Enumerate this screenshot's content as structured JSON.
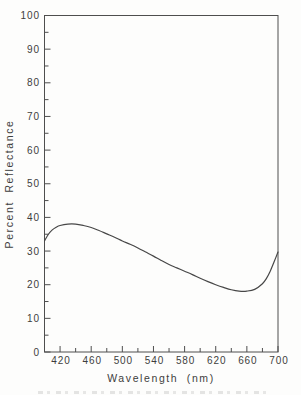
{
  "chart_data": {
    "type": "line",
    "title": "",
    "xlabel": "Wavelength  (nm)",
    "ylabel": "Percent  Reflectance",
    "xlim": [
      400,
      700
    ],
    "ylim": [
      0,
      100
    ],
    "grid": false,
    "legend": false,
    "frame": "full-box",
    "x_major_ticks": [
      420,
      460,
      500,
      540,
      580,
      620,
      660,
      700
    ],
    "x_minor_ticks": [
      440,
      480,
      520,
      560,
      600,
      640,
      680
    ],
    "x_tick_labels": [
      "420",
      "460",
      "500",
      "540",
      "580",
      "620",
      "660",
      "700"
    ],
    "y_major_ticks": [
      0,
      10,
      20,
      30,
      40,
      50,
      60,
      70,
      80,
      90,
      100
    ],
    "y_minor_ticks": [
      5,
      15,
      25,
      35,
      45,
      55,
      65,
      75,
      85,
      95
    ],
    "y_tick_labels": [
      "0",
      "10",
      "20",
      "30",
      "40",
      "50",
      "60",
      "70",
      "80",
      "90",
      "100"
    ],
    "series": [
      {
        "name": "reflectance-curve",
        "x": [
          400,
          405,
          410,
          415,
          420,
          430,
          440,
          450,
          460,
          470,
          480,
          490,
          500,
          510,
          520,
          530,
          540,
          550,
          560,
          570,
          580,
          590,
          600,
          610,
          620,
          630,
          640,
          650,
          660,
          670,
          680,
          685,
          690,
          695,
          700
        ],
        "y": [
          33,
          35,
          36.3,
          37.1,
          37.6,
          38,
          38,
          37.6,
          37,
          36.1,
          35.1,
          34.1,
          33,
          32,
          30.9,
          29.7,
          28.5,
          27.2,
          26,
          25,
          24,
          23,
          21.9,
          20.9,
          20,
          19.2,
          18.5,
          18.1,
          18.1,
          18.6,
          20.3,
          21.8,
          24,
          26.8,
          29.7
        ]
      }
    ],
    "colors": {
      "line": "#474747",
      "frame": "#4e4e4e",
      "tick": "#4e4e4e",
      "text": "#3d3d3d",
      "background": "#fdfdfc"
    }
  }
}
